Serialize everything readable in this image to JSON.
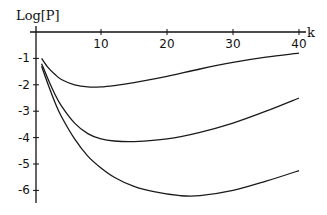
{
  "chart_data": {
    "type": "line",
    "title": "",
    "xlabel": "k",
    "ylabel": "Log[P]",
    "xlim": [
      0,
      41
    ],
    "ylim": [
      -6.5,
      0
    ],
    "grid": false,
    "legend": null,
    "x_ticks": [
      10,
      20,
      30,
      40
    ],
    "x_tick_labels": [
      "10",
      "20",
      "30",
      "40"
    ],
    "y_ticks": [
      -1,
      -2,
      -3,
      -4,
      -5,
      -6
    ],
    "y_tick_labels": [
      "-1",
      "-2",
      "-3",
      "-4",
      "-5",
      "-6"
    ],
    "series": [
      {
        "name": "curve-top",
        "x": [
          1,
          2,
          3,
          4,
          6,
          8,
          10,
          12,
          15,
          20,
          25,
          30,
          35,
          40
        ],
        "values": [
          -1.0,
          -1.35,
          -1.6,
          -1.8,
          -2.0,
          -2.08,
          -2.08,
          -2.03,
          -1.92,
          -1.68,
          -1.4,
          -1.15,
          -0.95,
          -0.8
        ]
      },
      {
        "name": "curve-middle",
        "x": [
          1,
          2,
          3,
          4,
          6,
          8,
          10,
          12,
          15,
          20,
          25,
          30,
          35,
          40
        ],
        "values": [
          -1.2,
          -1.8,
          -2.35,
          -2.8,
          -3.45,
          -3.85,
          -4.05,
          -4.13,
          -4.15,
          -4.05,
          -3.8,
          -3.45,
          -3.0,
          -2.5
        ]
      },
      {
        "name": "curve-bottom",
        "x": [
          1,
          2,
          3,
          4,
          6,
          8,
          10,
          12,
          15,
          18,
          22,
          25,
          30,
          35,
          40
        ],
        "values": [
          -1.3,
          -2.0,
          -2.65,
          -3.2,
          -4.05,
          -4.7,
          -5.15,
          -5.5,
          -5.85,
          -6.05,
          -6.2,
          -6.2,
          -6.0,
          -5.65,
          -5.25
        ]
      }
    ]
  }
}
